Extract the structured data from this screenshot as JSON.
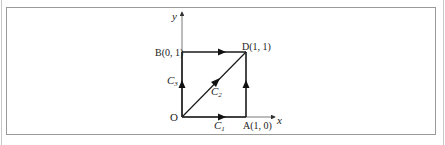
{
  "diagram": {
    "axes": {
      "x_label": "x",
      "y_label": "y"
    },
    "points": {
      "origin": "O",
      "A": "A(1, 0)",
      "B": "B(0, 1)",
      "D": "D(1, 1)"
    },
    "paths": {
      "C1": {
        "base": "C",
        "sub": "1",
        "description": "O to A to D"
      },
      "C2": {
        "base": "C",
        "sub": "2",
        "description": "O to D diagonal"
      },
      "C3": {
        "base": "C",
        "sub": "3",
        "description": "O to B to D"
      }
    },
    "colors": {
      "line": "#1a1a1a",
      "frame": "#9a9a9a"
    }
  }
}
